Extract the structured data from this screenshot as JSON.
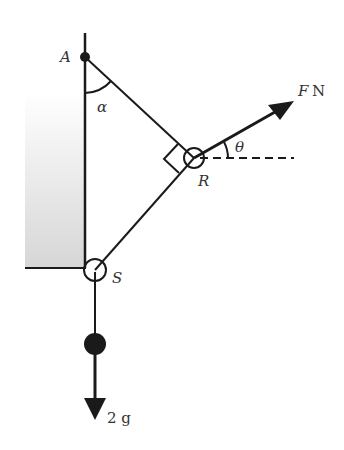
{
  "diagram": {
    "labels": {
      "A": "A",
      "alpha": "α",
      "R": "R",
      "S": "S",
      "theta": "θ",
      "force_F": "F",
      "force_unit": "N",
      "weight": "2 g"
    },
    "colors": {
      "line": "#1a1a1a",
      "text": "#333333",
      "wall_shade_top": "#ffffff",
      "wall_shade_bottom": "#d9d9d9"
    }
  }
}
